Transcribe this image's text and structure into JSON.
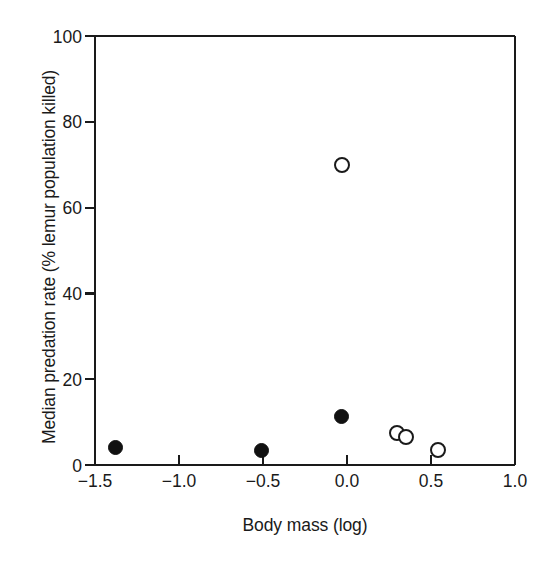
{
  "figure": {
    "background": "#ffffff",
    "ink_color": "#1a1a1a"
  },
  "axes": {
    "x_title": "Body mass (log)",
    "y_title": "Median predation rate (% lemur population killed)",
    "x_ticks": [
      "−1.5",
      "−1.0",
      "−0.5",
      "0.0",
      "0.5",
      "1.0"
    ],
    "y_ticks": [
      "0",
      "20",
      "40",
      "60",
      "80",
      "100"
    ]
  },
  "chart_data": {
    "type": "scatter",
    "title": "",
    "xlabel": "Body mass (log)",
    "ylabel": "Median predation rate (% lemur population killed)",
    "xlim": [
      -1.5,
      1.0
    ],
    "ylim": [
      0,
      100
    ],
    "xticks": [
      -1.5,
      -1.0,
      -0.5,
      0.0,
      0.5,
      1.0
    ],
    "yticks": [
      0,
      20,
      40,
      60,
      80,
      100
    ],
    "grid": false,
    "legend": "none",
    "tick_direction": {
      "x": "in",
      "y": "out"
    },
    "series": [
      {
        "name": "filled-circle",
        "marker": "filled circle",
        "color": "#111111",
        "points": [
          {
            "x": -1.38,
            "y": 4.0
          },
          {
            "x": -0.51,
            "y": 3.3
          },
          {
            "x": -0.03,
            "y": 11.2
          }
        ]
      },
      {
        "name": "open-circle",
        "marker": "open circle",
        "color": "#1a1a1a",
        "points": [
          {
            "x": -0.03,
            "y": 70.0
          },
          {
            "x": 0.3,
            "y": 7.5
          },
          {
            "x": 0.35,
            "y": 6.5
          },
          {
            "x": 0.54,
            "y": 3.6
          }
        ]
      }
    ]
  }
}
